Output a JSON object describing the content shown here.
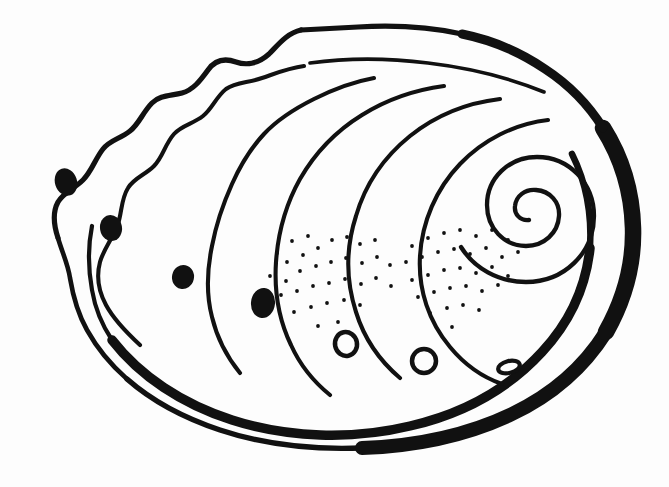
{
  "meta": {
    "title": "Abalone Shell Line Illustration",
    "style": "black-and-white-line-art",
    "canvas_width": 669,
    "canvas_height": 487
  },
  "palette": {
    "background": "#fdfdfd",
    "ink": "#111111",
    "shell_interior": "#ffffff"
  },
  "drawing": {
    "body_outline": {
      "name": "shell-body-outline",
      "description": "large oval shell body occupying most of the canvas",
      "bounds": {
        "x": 38,
        "y": 28,
        "width": 600,
        "height": 420
      },
      "path": "M 300 31 C 360 28 430 40 490 62 C 548 84 594 120 616 168 C 638 218 636 272 612 320 C 586 372 532 408 470 424 C 400 442 318 442 248 424 C 180 406 124 372 92 326 C 60 280 48 228 60 186 C 70 150 92 124 118 108"
    },
    "thick_rim": {
      "name": "shell-thick-rim",
      "description": "heavy black rim sweeping down the right side and along the bottom, tapering at both ends",
      "max_stroke_px": 17,
      "min_stroke_px": 3
    },
    "scalloped_edge": {
      "name": "scalloped-mantle-edge",
      "description": "undulating wavy growth edge along the upper-left of the shell",
      "wave_count": 5
    },
    "growth_lines": {
      "name": "growth-ridge-lines",
      "count": 6,
      "description": "concentric ridge lines sweeping from the upper-left scalloped edge toward the spiral apex at upper-right",
      "stroke_px": 3.6
    },
    "spiral": {
      "name": "shell-spiral-apex",
      "center_x": 527,
      "center_y": 212,
      "turns": 1.9,
      "start_radius": 8,
      "end_radius": 78,
      "stroke_px": 4,
      "direction": "counterclockwise-inward"
    },
    "solid_pores": {
      "name": "solid-respiratory-pores",
      "count": 4,
      "description": "filled black oval holes spaced along the left-hand growth ridges",
      "items": [
        {
          "cx": 66,
          "cy": 182,
          "rx": 11,
          "ry": 14,
          "rotate": -18
        },
        {
          "cx": 111,
          "cy": 228,
          "rx": 11,
          "ry": 13,
          "rotate": -10
        },
        {
          "cx": 183,
          "cy": 277,
          "rx": 11,
          "ry": 12,
          "rotate": 12
        },
        {
          "cx": 263,
          "cy": 303,
          "rx": 12,
          "ry": 15,
          "rotate": 6
        }
      ]
    },
    "open_pores": {
      "name": "open-ring-pores",
      "count": 3,
      "description": "small outlined ring-shaped holes near the lower edge of the shell",
      "stroke_px": 4.5,
      "items": [
        {
          "cx": 346,
          "cy": 344,
          "rx": 11,
          "ry": 12,
          "rotate": -12
        },
        {
          "cx": 424,
          "cy": 361,
          "rx": 12,
          "ry": 12,
          "rotate": 0
        },
        {
          "cx": 509,
          "cy": 367,
          "rx": 11,
          "ry": 6,
          "rotate": -14
        }
      ]
    },
    "stipple_fields": [
      {
        "name": "stipple-field-left",
        "dot_count": 34,
        "dot_radius_px": 1.9,
        "region": {
          "x": 268,
          "y": 234,
          "width": 130,
          "height": 110
        }
      },
      {
        "name": "stipple-field-right",
        "dot_count": 33,
        "dot_radius_px": 1.9,
        "region": {
          "x": 404,
          "y": 228,
          "width": 120,
          "height": 110
        }
      }
    ]
  }
}
